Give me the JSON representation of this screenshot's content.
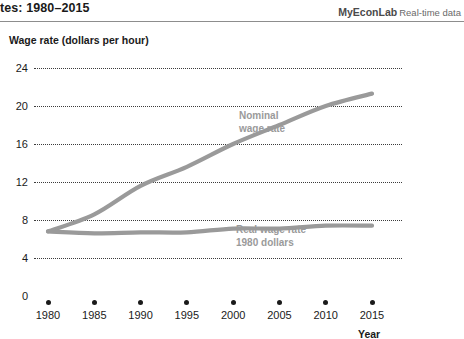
{
  "header": {
    "title": "tes: 1980–2015",
    "brand": "MyEconLab",
    "brand_sub": "Real-time data"
  },
  "chart_data": {
    "type": "line",
    "title": "",
    "ylabel": "Wage rate (dollars per hour)",
    "xlabel": "Year",
    "ylim": [
      0,
      26
    ],
    "xlim": [
      1979,
      2017
    ],
    "grid": true,
    "grid_style": "dotted-horizontal",
    "legend": "inline-annotation",
    "y_ticks": [
      0,
      4,
      8,
      12,
      16,
      20,
      24
    ],
    "x_ticks": [
      1980,
      1985,
      1990,
      1995,
      2000,
      2005,
      2010,
      2015
    ],
    "x_tick_labels": [
      "1980",
      "1985",
      "1990",
      "1995",
      "2000",
      "2005",
      "2010",
      "2015"
    ],
    "y_tick_labels": [
      "0",
      "4",
      "8",
      "12",
      "16",
      "20",
      "24"
    ],
    "x": [
      1980,
      1985,
      1990,
      1995,
      2000,
      2005,
      2010,
      2015
    ],
    "series": [
      {
        "name": "Nominal wage rate",
        "label_line1": "Nominal",
        "label_line2": "wage rate",
        "color": "#9a9a9a",
        "values": [
          6.8,
          8.6,
          11.6,
          13.6,
          16.0,
          18.0,
          20.0,
          21.3
        ]
      },
      {
        "name": "Real wage rate 1980 dollars",
        "label_line1": "Real wage rate",
        "label_line2": "1980 dollars",
        "color": "#9a9a9a",
        "values": [
          6.8,
          6.6,
          6.7,
          6.7,
          7.1,
          7.1,
          7.4,
          7.4
        ]
      }
    ]
  }
}
